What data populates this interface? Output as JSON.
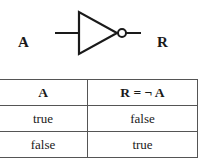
{
  "diagram": {
    "type": "logic-gate",
    "gate": "NOT",
    "input_label": "A",
    "output_label": "R"
  },
  "truth_table": {
    "headers": [
      "A",
      "R = ¬ A"
    ],
    "rows": [
      [
        "true",
        "false"
      ],
      [
        "false",
        "true"
      ]
    ]
  }
}
